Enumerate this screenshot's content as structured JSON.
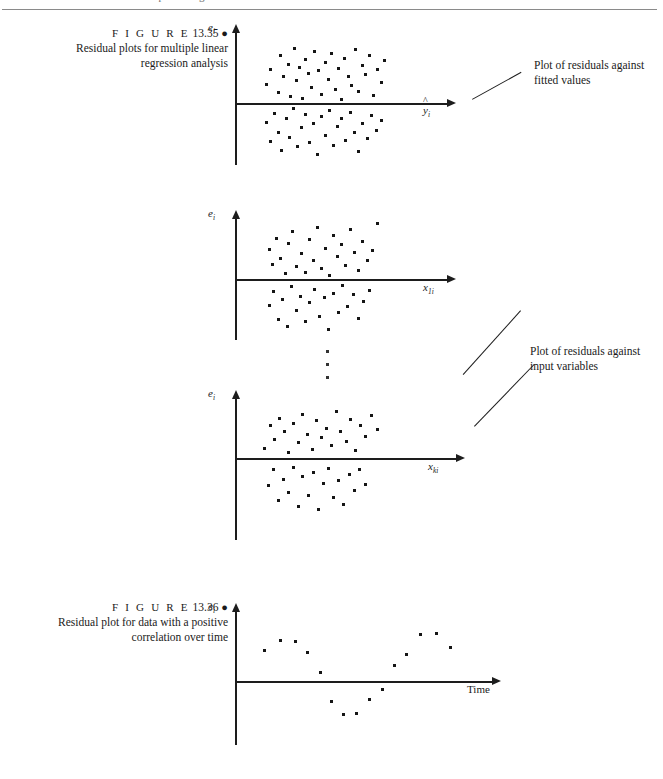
{
  "page": {
    "running_head_number": "716",
    "running_head_text": "CHAPTER 13  Multiple Regression",
    "background_color": "#ffffff",
    "ink_color": "#1a1a1a"
  },
  "figures": [
    {
      "id": "figure-13-35",
      "label_word": "F I G U R E",
      "number": "13.35",
      "bullet": "●",
      "caption_line1": "Residual plots for multiple linear",
      "caption_line2": "regression analysis"
    },
    {
      "id": "figure-13-36",
      "label_word": "F I G U R E",
      "number": "13.36",
      "bullet": "●",
      "caption_line1": "Residual plot for data with a positive",
      "caption_line2": "correlation over time"
    }
  ],
  "annotations": [
    {
      "id": "annotation-fitted-values",
      "line1": "Plot of residuals against",
      "line2": "fitted values"
    },
    {
      "id": "annotation-input-variables",
      "line1": "Plot of residuals against",
      "line2": "input variables"
    }
  ],
  "ellipsis": {
    "glyph": "⋮",
    "dot_count": 3
  },
  "chart_data": [
    {
      "id": "plot-residuals-vs-fitted",
      "type": "scatter",
      "title": "",
      "xlabel": "ŷi",
      "ylabel": "ei",
      "xlabel_plain": "yhat_i",
      "ylabel_plain": "e_i",
      "grid": false,
      "legend": "none",
      "xlim": [
        0,
        1
      ],
      "ylim": [
        -1,
        1
      ],
      "description": "Random scatter of residuals symmetric about zero, no pattern",
      "points": [
        [
          0.148,
          0.3
        ],
        [
          0.168,
          0.54
        ],
        [
          0.205,
          0.17
        ],
        [
          0.213,
          0.76
        ],
        [
          0.226,
          0.43
        ],
        [
          0.25,
          0.62
        ],
        [
          0.262,
          0.11
        ],
        [
          0.277,
          0.88
        ],
        [
          0.291,
          0.355
        ],
        [
          0.305,
          0.575
        ],
        [
          0.318,
          0.075
        ],
        [
          0.333,
          0.705
        ],
        [
          0.345,
          0.47
        ],
        [
          0.36,
          0.245
        ],
        [
          0.374,
          0.83
        ],
        [
          0.392,
          0.52
        ],
        [
          0.408,
          0.14
        ],
        [
          0.423,
          0.66
        ],
        [
          0.438,
          0.38
        ],
        [
          0.452,
          0.8
        ],
        [
          0.47,
          0.215
        ],
        [
          0.486,
          0.56
        ],
        [
          0.5,
          0.06
        ],
        [
          0.516,
          0.72
        ],
        [
          0.533,
          0.43
        ],
        [
          0.548,
          0.29
        ],
        [
          0.564,
          0.87
        ],
        [
          0.58,
          0.185
        ],
        [
          0.598,
          0.61
        ],
        [
          0.615,
          0.455
        ],
        [
          0.632,
          0.76
        ],
        [
          0.65,
          0.125
        ],
        [
          0.668,
          0.54
        ],
        [
          0.686,
          0.33
        ],
        [
          0.704,
          0.69
        ],
        [
          0.148,
          -0.31
        ],
        [
          0.166,
          -0.62
        ],
        [
          0.186,
          -0.175
        ],
        [
          0.203,
          -0.48
        ],
        [
          0.22,
          -0.76
        ],
        [
          0.24,
          -0.25
        ],
        [
          0.258,
          -0.56
        ],
        [
          0.276,
          -0.095
        ],
        [
          0.294,
          -0.7
        ],
        [
          0.312,
          -0.4
        ],
        [
          0.331,
          -0.18
        ],
        [
          0.35,
          -0.64
        ],
        [
          0.368,
          -0.33
        ],
        [
          0.386,
          -0.825
        ],
        [
          0.405,
          -0.215
        ],
        [
          0.424,
          -0.53
        ],
        [
          0.443,
          -0.12
        ],
        [
          0.462,
          -0.69
        ],
        [
          0.48,
          -0.385
        ],
        [
          0.5,
          -0.255
        ],
        [
          0.52,
          -0.6
        ],
        [
          0.54,
          -0.15
        ],
        [
          0.56,
          -0.47
        ],
        [
          0.58,
          -0.79
        ],
        [
          0.6,
          -0.33
        ],
        [
          0.62,
          -0.58
        ],
        [
          0.642,
          -0.2
        ],
        [
          0.664,
          -0.44
        ],
        [
          0.686,
          -0.29
        ]
      ]
    },
    {
      "id": "plot-residuals-vs-x1",
      "type": "scatter",
      "title": "",
      "xlabel": "x1i",
      "ylabel": "ei",
      "xlabel_plain": "x_1i",
      "ylabel_plain": "e_i",
      "grid": false,
      "legend": "none",
      "xlim": [
        0,
        1
      ],
      "ylim": [
        -1,
        1
      ],
      "description": "Random scatter of residuals about zero versus first input variable",
      "points": [
        [
          0.16,
          0.47
        ],
        [
          0.175,
          0.23
        ],
        [
          0.196,
          0.65
        ],
        [
          0.215,
          0.33
        ],
        [
          0.236,
          0.09
        ],
        [
          0.253,
          0.56
        ],
        [
          0.272,
          0.76
        ],
        [
          0.29,
          0.2
        ],
        [
          0.31,
          0.4
        ],
        [
          0.33,
          0.11
        ],
        [
          0.35,
          0.62
        ],
        [
          0.368,
          0.3
        ],
        [
          0.388,
          0.825
        ],
        [
          0.405,
          0.165
        ],
        [
          0.425,
          0.48
        ],
        [
          0.442,
          0.06
        ],
        [
          0.462,
          0.69
        ],
        [
          0.48,
          0.35
        ],
        [
          0.5,
          0.54
        ],
        [
          0.52,
          0.215
        ],
        [
          0.54,
          0.78
        ],
        [
          0.56,
          0.42
        ],
        [
          0.58,
          0.13
        ],
        [
          0.6,
          0.6
        ],
        [
          0.622,
          0.29
        ],
        [
          0.645,
          0.455
        ],
        [
          0.668,
          0.88
        ],
        [
          0.16,
          -0.42
        ],
        [
          0.182,
          -0.2
        ],
        [
          0.203,
          -0.64
        ],
        [
          0.224,
          -0.33
        ],
        [
          0.245,
          -0.76
        ],
        [
          0.266,
          -0.12
        ],
        [
          0.288,
          -0.5
        ],
        [
          0.308,
          -0.28
        ],
        [
          0.33,
          -0.68
        ],
        [
          0.352,
          -0.38
        ],
        [
          0.374,
          -0.165
        ],
        [
          0.396,
          -0.59
        ],
        [
          0.418,
          -0.3
        ],
        [
          0.44,
          -0.8
        ],
        [
          0.462,
          -0.23
        ],
        [
          0.484,
          -0.53
        ],
        [
          0.506,
          -0.11
        ],
        [
          0.53,
          -0.43
        ],
        [
          0.554,
          -0.25
        ],
        [
          0.578,
          -0.62
        ],
        [
          0.604,
          -0.35
        ],
        [
          0.63,
          -0.18
        ]
      ]
    },
    {
      "id": "plot-residuals-vs-xk",
      "type": "scatter",
      "title": "",
      "xlabel": "xki",
      "ylabel": "ei",
      "xlabel_plain": "x_ki",
      "ylabel_plain": "e_i",
      "grid": false,
      "legend": "none",
      "xlim": [
        0,
        1
      ],
      "ylim": [
        -1,
        1
      ],
      "description": "Random scatter of residuals about zero versus k-th input variable",
      "points": [
        [
          0.135,
          0.16
        ],
        [
          0.158,
          0.52
        ],
        [
          0.178,
          0.3
        ],
        [
          0.2,
          0.64
        ],
        [
          0.222,
          0.43
        ],
        [
          0.243,
          0.09
        ],
        [
          0.263,
          0.56
        ],
        [
          0.285,
          0.25
        ],
        [
          0.305,
          0.7
        ],
        [
          0.326,
          0.38
        ],
        [
          0.347,
          0.14
        ],
        [
          0.368,
          0.6
        ],
        [
          0.39,
          0.33
        ],
        [
          0.412,
          0.48
        ],
        [
          0.434,
          0.2
        ],
        [
          0.455,
          0.75
        ],
        [
          0.477,
          0.42
        ],
        [
          0.5,
          0.27
        ],
        [
          0.522,
          0.62
        ],
        [
          0.544,
          0.12
        ],
        [
          0.566,
          0.53
        ],
        [
          0.59,
          0.345
        ],
        [
          0.614,
          0.68
        ],
        [
          0.64,
          0.46
        ],
        [
          0.15,
          -0.44
        ],
        [
          0.172,
          -0.19
        ],
        [
          0.196,
          -0.68
        ],
        [
          0.218,
          -0.35
        ],
        [
          0.24,
          -0.56
        ],
        [
          0.262,
          -0.15
        ],
        [
          0.285,
          -0.78
        ],
        [
          0.306,
          -0.3
        ],
        [
          0.33,
          -0.6
        ],
        [
          0.352,
          -0.23
        ],
        [
          0.375,
          -0.83
        ],
        [
          0.398,
          -0.41
        ],
        [
          0.42,
          -0.17
        ],
        [
          0.443,
          -0.64
        ],
        [
          0.466,
          -0.36
        ],
        [
          0.49,
          -0.75
        ],
        [
          0.514,
          -0.26
        ],
        [
          0.538,
          -0.52
        ],
        [
          0.562,
          -0.19
        ],
        [
          0.588,
          -0.42
        ]
      ]
    },
    {
      "id": "plot-residuals-vs-time",
      "type": "scatter",
      "title": "",
      "xlabel": "Time",
      "ylabel": "ei",
      "ylabel_plain": "e_i",
      "grid": false,
      "legend": "none",
      "xlim": [
        0,
        1
      ],
      "ylim": [
        -1,
        1
      ],
      "description": "Residuals show a smooth cyclical pattern over time indicating positive autocorrelation",
      "points": [
        [
          0.115,
          0.43
        ],
        [
          0.175,
          0.56
        ],
        [
          0.235,
          0.545
        ],
        [
          0.282,
          0.39
        ],
        [
          0.33,
          0.115
        ],
        [
          0.375,
          -0.29
        ],
        [
          0.42,
          -0.47
        ],
        [
          0.47,
          -0.455
        ],
        [
          0.52,
          -0.26
        ],
        [
          0.572,
          -0.115
        ],
        [
          0.62,
          0.215
        ],
        [
          0.665,
          0.375
        ],
        [
          0.72,
          0.64
        ],
        [
          0.78,
          0.66
        ],
        [
          0.835,
          0.47
        ]
      ]
    }
  ]
}
